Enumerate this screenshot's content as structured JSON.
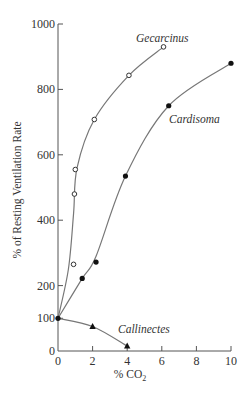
{
  "chart_data": {
    "type": "line",
    "title": "",
    "xlabel": "% CO2",
    "ylabel": "% of Resting Ventilation Rate",
    "xlim": [
      0,
      10
    ],
    "ylim": [
      0,
      1000
    ],
    "x_ticks": [
      0,
      2,
      4,
      6,
      8,
      10
    ],
    "y_ticks": [
      0,
      100,
      200,
      400,
      600,
      800,
      1000
    ],
    "grid": false,
    "legend": "inline labels",
    "series": [
      {
        "name": "Gecarcinus",
        "marker": "open-circle",
        "x": [
          0,
          0.9,
          0.95,
          1.0,
          2.1,
          4.1,
          6.1
        ],
        "y": [
          100,
          265,
          480,
          555,
          708,
          843,
          930
        ]
      },
      {
        "name": "Cardisoma",
        "marker": "filled-circle",
        "x": [
          0,
          1.4,
          2.2,
          3.9,
          6.4,
          10
        ],
        "y": [
          100,
          222,
          272,
          535,
          750,
          880
        ]
      },
      {
        "name": "Callinectes",
        "marker": "filled-triangle",
        "x": [
          0,
          2,
          4
        ],
        "y": [
          100,
          75,
          15
        ]
      }
    ]
  },
  "labels": {
    "ylabel": "% of Resting Ventilation Rate",
    "xlabel_main": "% CO",
    "xlabel_sub": "2",
    "gecarcinus": "Gecarcinus",
    "cardisoma": "Cardisoma",
    "callinectes": "Callinectes"
  },
  "ticks": {
    "x": [
      "0",
      "2",
      "4",
      "6",
      "8",
      "10"
    ],
    "y": [
      "0",
      "100",
      "200",
      "400",
      "600",
      "800",
      "1000"
    ]
  }
}
